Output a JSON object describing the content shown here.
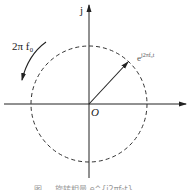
{
  "diagram": {
    "type": "complex-plane-phasor",
    "axis_labels": {
      "imaginary": "j",
      "origin": "O"
    },
    "vector_label": "e^{j2πf₀t}",
    "vector_label_base": "e",
    "vector_label_exp": "j2πf₀t",
    "rotation_label": "2π f₀",
    "rotation_direction": "counterclockwise",
    "circle_style": "dashed",
    "caption": "图 …  旋转相量 e^{j2πf₀t}",
    "colors": {
      "stroke": "#222222",
      "background": "#ffffff"
    }
  }
}
